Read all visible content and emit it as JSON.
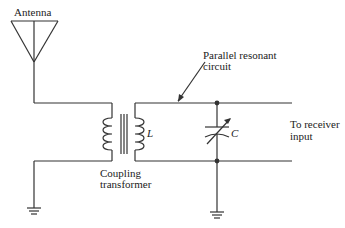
{
  "diagram": {
    "labels": {
      "antenna": "Antenna",
      "inductor": "L",
      "coupling_line1": "Coupling",
      "coupling_line2": "transformer",
      "resonant_line1": "Parallel resonant",
      "resonant_line2": "circuit",
      "capacitor": "C",
      "output_line1": "To receiver",
      "output_line2": "input"
    },
    "components": [
      "antenna",
      "coupling-transformer",
      "inductor-L",
      "variable-capacitor-C",
      "ground-left",
      "ground-right"
    ],
    "colors": {
      "line": "#333333",
      "background": "#ffffff"
    }
  }
}
